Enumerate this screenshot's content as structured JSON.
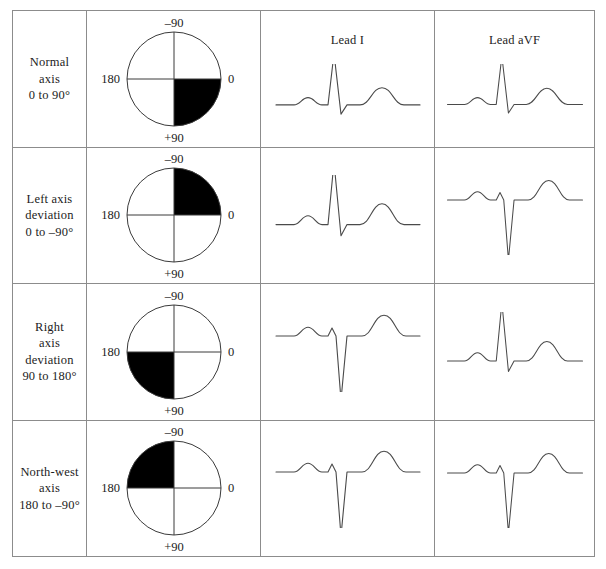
{
  "figure": {
    "type": "table"
  },
  "columns": {
    "label_header": "",
    "circle_header": "",
    "lead1_header": "Lead I",
    "leadavf_header": "Lead aVF"
  },
  "circle_labels": {
    "top": "–90",
    "right": "0",
    "bottom": "+90",
    "left": "180"
  },
  "rows": [
    {
      "label_lines": [
        "Normal",
        "axis",
        "0 to 90°"
      ],
      "shaded_quadrant": "lower-right",
      "lead1_polarity": "positive",
      "leadavf_polarity": "positive"
    },
    {
      "label_lines": [
        "Left axis",
        "deviation",
        "0 to –90°"
      ],
      "shaded_quadrant": "upper-right",
      "lead1_polarity": "positive",
      "leadavf_polarity": "negative"
    },
    {
      "label_lines": [
        "Right",
        "axis",
        "deviation",
        "90 to 180°"
      ],
      "shaded_quadrant": "lower-left",
      "lead1_polarity": "negative",
      "leadavf_polarity": "positive"
    },
    {
      "label_lines": [
        "North-west",
        "axis",
        "180 to –90°"
      ],
      "shaded_quadrant": "upper-left",
      "lead1_polarity": "negative",
      "leadavf_polarity": "negative"
    }
  ],
  "colors": {
    "shade": "#000000",
    "circle_stroke": "#3a3a3a",
    "trace_stroke": "#4a4a4a",
    "border": "#8c8c8c",
    "text": "#1c1c1c",
    "background": "#ffffff"
  }
}
